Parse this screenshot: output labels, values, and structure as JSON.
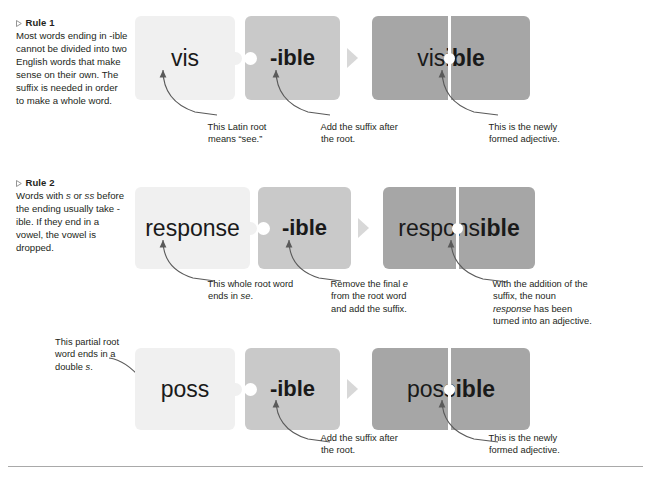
{
  "rules": [
    {
      "heading": "Rule 1",
      "body_parts": [
        {
          "text": "Most words ending in -ible cannot be divided into two English words that make sense on their own. The suffix is needed in order to make a whole word.",
          "italic": false
        }
      ]
    },
    {
      "heading": "Rule 2",
      "body_parts": [
        {
          "text": "Words with ",
          "italic": false
        },
        {
          "text": "s",
          "italic": true
        },
        {
          "text": " or ",
          "italic": false
        },
        {
          "text": "ss",
          "italic": true
        },
        {
          "text": " before the ending usually take -ible. If they end in a vowel, the vowel is dropped.",
          "italic": false
        }
      ]
    }
  ],
  "rows": [
    {
      "root_word": "vis",
      "suffix": "-ible",
      "combined_prefix": "vis",
      "combined_suffix": "ible",
      "annotations": [
        {
          "name": "root-note",
          "parts": [
            {
              "text": "This Latin root means “see.”",
              "italic": false
            }
          ]
        },
        {
          "name": "suffix-note",
          "parts": [
            {
              "text": "Add the suffix after the root.",
              "italic": false
            }
          ]
        },
        {
          "name": "result-note",
          "parts": [
            {
              "text": "This is the newly formed adjective.",
              "italic": false
            }
          ]
        }
      ]
    },
    {
      "root_word": "response",
      "suffix": "-ible",
      "combined_prefix": "respons",
      "combined_suffix": "ible",
      "annotations": [
        {
          "name": "root-note",
          "parts": [
            {
              "text": "This whole root word ends in ",
              "italic": false
            },
            {
              "text": "se",
              "italic": true
            },
            {
              "text": ".",
              "italic": false
            }
          ]
        },
        {
          "name": "suffix-note",
          "parts": [
            {
              "text": "Remove the final ",
              "italic": false
            },
            {
              "text": "e",
              "italic": true
            },
            {
              "text": " from the root word and add the suffix.",
              "italic": false
            }
          ]
        },
        {
          "name": "result-note",
          "parts": [
            {
              "text": "With the addition of the suffix, the noun ",
              "italic": false
            },
            {
              "text": "response",
              "italic": true
            },
            {
              "text": " has been turned into an adjective.",
              "italic": false
            }
          ]
        }
      ]
    },
    {
      "root_word": "poss",
      "suffix": "-ible",
      "combined_prefix": "poss",
      "combined_suffix": "ible",
      "annotations": [
        {
          "name": "root-note",
          "parts": [
            {
              "text": "This partial root word ends in a double ",
              "italic": false
            },
            {
              "text": "s",
              "italic": true
            },
            {
              "text": ".",
              "italic": false
            }
          ]
        },
        {
          "name": "suffix-note",
          "parts": [
            {
              "text": "Add the suffix after the root.",
              "italic": false
            }
          ]
        },
        {
          "name": "result-note",
          "parts": [
            {
              "text": "This is the newly formed adjective.",
              "italic": false
            }
          ]
        }
      ]
    }
  ],
  "colors": {
    "card_light": "#f0f0f0",
    "card_mid": "#c9c9c9",
    "card_dark": "#a6a6a6",
    "text": "#231f20",
    "arrow": "#5a5a5a",
    "rule_line": "#a9a9a9"
  }
}
